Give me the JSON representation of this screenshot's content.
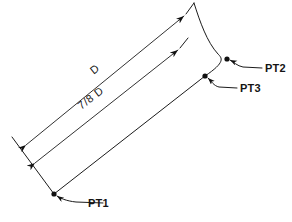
{
  "diagram": {
    "background_color": "#ffffff",
    "line_color": "#1b1b1b",
    "width": 292,
    "height": 222,
    "dimensions": [
      {
        "id": "d-full",
        "label": "D",
        "name": "dimension-d",
        "start": [
          24,
          143
        ],
        "end": [
          186,
          14
        ],
        "label_pos": [
          97,
          72
        ],
        "rotation": -38.5
      },
      {
        "id": "d-seven-eighths",
        "label": "7/8 D",
        "name": "dimension-seven-eighths-d",
        "start": [
          33,
          161
        ],
        "end": [
          180,
          48
        ],
        "label_pos": [
          93,
          101
        ],
        "rotation": -37.5
      }
    ],
    "points": [
      {
        "id": "pt1",
        "label": "PT1",
        "dot": [
          54,
          194
        ],
        "leader_from": [
          103,
          203
        ],
        "leader_elbow": [
          76,
          202
        ],
        "label_pos": [
          88,
          207
        ]
      },
      {
        "id": "pt2",
        "label": "PT2",
        "dot": [
          227,
          59
        ],
        "leader_from": [
          262,
          68
        ],
        "leader_elbow": [
          243,
          67
        ],
        "label_pos": [
          265,
          72
        ]
      },
      {
        "id": "pt3",
        "label": "PT3",
        "dot": [
          205,
          76
        ],
        "leader_from": [
          237,
          88
        ],
        "leader_elbow": [
          219,
          87
        ],
        "label_pos": [
          240,
          92
        ]
      }
    ],
    "geometry": {
      "outer_curve": "Upper right arc from top extension down through PT2 to PT3",
      "lower_edge": "Line from PT1 up-right to PT3",
      "left_extension": "Short extension line through the two dimension arrow origins down to PT1"
    }
  }
}
